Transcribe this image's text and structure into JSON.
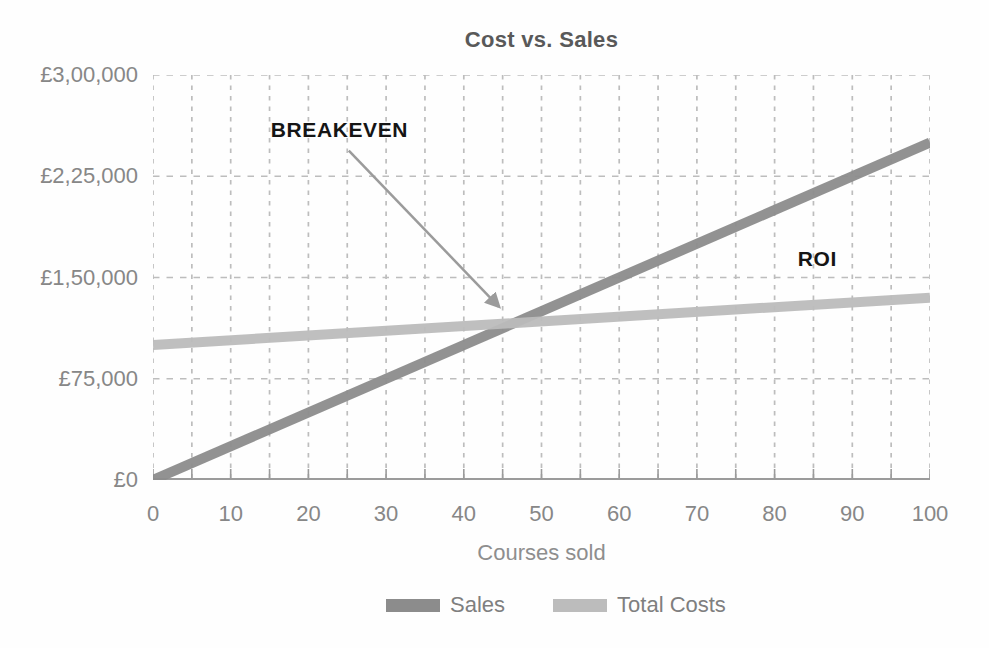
{
  "figure": {
    "title": "Cost vs. Sales",
    "x_axis_label": "Courses sold"
  },
  "legend": {
    "items": [
      {
        "label": "Sales",
        "color": "#8c8c8c"
      },
      {
        "label": "Total Costs",
        "color": "#bcbcbc"
      }
    ]
  },
  "chart_data": {
    "type": "line",
    "title": "Cost vs. Sales",
    "xlabel": "Courses sold",
    "ylabel": "",
    "xlim": [
      0,
      100
    ],
    "ylim": [
      0,
      300000
    ],
    "x_tick_values": [
      0,
      10,
      20,
      30,
      40,
      50,
      60,
      70,
      80,
      90,
      100
    ],
    "x_minor_step": 5,
    "y_ticks": [
      {
        "value": 0,
        "label": "£0"
      },
      {
        "value": 75000,
        "label": "£75,000"
      },
      {
        "value": 150000,
        "label": "£1,50,000"
      },
      {
        "value": 225000,
        "label": "£2,25,000"
      },
      {
        "value": 300000,
        "label": "£3,00,000"
      }
    ],
    "grid": {
      "style": "dashed",
      "x_step": 5,
      "color": "#bdbdbd"
    },
    "axis_color": "#9b9b9b",
    "series": [
      {
        "name": "Sales",
        "color": "#8c8c8c",
        "points": [
          [
            0,
            0
          ],
          [
            100,
            250000
          ]
        ]
      },
      {
        "name": "Total Costs",
        "color": "#bcbcbc",
        "points": [
          [
            0,
            100000
          ],
          [
            100,
            135000
          ]
        ]
      }
    ],
    "breakeven_point": {
      "x": 46.5,
      "y": 116000
    },
    "annotations": [
      {
        "id": "breakeven",
        "text": "BREAKEVEN",
        "x": 24,
        "y": 259000,
        "arrow": {
          "from": [
            25.2,
            244000
          ],
          "to": [
            44.5,
            128500
          ],
          "color": "#9b9b9b"
        }
      },
      {
        "id": "roi",
        "text": "ROI",
        "x": 85.5,
        "y": 164000
      }
    ],
    "legend_position": "bottom"
  }
}
